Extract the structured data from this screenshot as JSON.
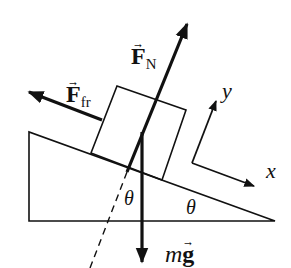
{
  "diagram": {
    "type": "free-body-diagram",
    "colors": {
      "stroke": "#111111",
      "background": "#ffffff"
    },
    "labels": {
      "normal_force": {
        "symbol": "F",
        "subscript": "N"
      },
      "friction_force": {
        "symbol": "F",
        "subscript": "fr"
      },
      "gravity": {
        "prefix": "m",
        "symbol": "g"
      },
      "axis_x": "x",
      "axis_y": "y",
      "angle_incline": "θ",
      "angle_vertical": "θ"
    }
  }
}
